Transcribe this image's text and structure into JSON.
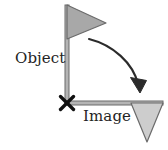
{
  "figure": {
    "background_color": "#ffffff",
    "labels": {
      "object": "Object",
      "image": "Image"
    },
    "colors": {
      "object_flag_fill": "#a8a8a8",
      "image_flag_fill": "#cdcdcd",
      "stroke": "#6b6b6b",
      "pole_fill": "#b4b4b4",
      "arrow": "#2b2b2b",
      "marker": "#111111",
      "text": "#242424"
    },
    "elements": {
      "object_flag": {
        "name": "object-flag-triangle",
        "description": "Right-pointing filled triangle at top of vertical pole",
        "points": "67,5 106,23 67,39",
        "fill": "#a8a8a8"
      },
      "object_pole": {
        "name": "object-flag-pole",
        "description": "Vertical pole from flag down to pivot point",
        "x1": 67,
        "y1": 5,
        "x2": 67,
        "y2": 104,
        "width": 4
      },
      "image_flag": {
        "name": "image-flag-triangle",
        "description": "Downward-pointing filled triangle at end of horizontal pole",
        "points": "131,103 163,103 147,142",
        "fill": "#cdcdcd"
      },
      "image_pole": {
        "name": "image-flag-pole",
        "description": "Horizontal pole from pivot point to image flag",
        "x1": 67,
        "y1": 103,
        "x2": 163,
        "y2": 103,
        "width": 4
      },
      "pivot_marker": {
        "name": "pivot-x-marker",
        "description": "Bold X marking the rotation pivot / center point",
        "cx": 67,
        "cy": 103,
        "size": 7
      },
      "rotation_arrow": {
        "name": "rotation-arrow",
        "description": "Curved arrow showing 90 degree clockwise rotation from object to image",
        "path": "M 89,39 C 112,45 133,63 139,86",
        "arrowhead": "139,92 132,76 147,80"
      }
    }
  }
}
